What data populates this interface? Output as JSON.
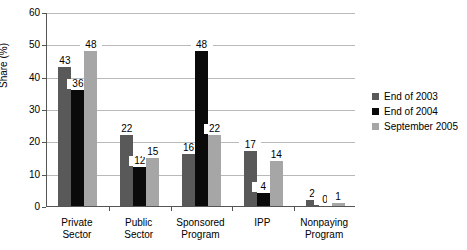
{
  "chart_data": {
    "type": "bar",
    "title": "",
    "xlabel": "",
    "ylabel": "Share (%)",
    "ylim": [
      0,
      60
    ],
    "ytick_values": [
      0,
      10,
      20,
      30,
      40,
      50,
      60
    ],
    "ytick_labels": [
      "0",
      "10",
      "20",
      "30",
      "40",
      "50",
      "60"
    ],
    "grid": true,
    "legend_position": "right",
    "categories": [
      "Private\nSector",
      "Public\nSector",
      "Sponsored\nProgram",
      "IPP",
      "Nonpaying\nProgram"
    ],
    "series": [
      {
        "name": "End of 2003",
        "color": "#595959",
        "values": [
          43,
          22,
          16,
          17,
          2
        ]
      },
      {
        "name": "End of 2004",
        "color": "#0a0a0a",
        "values": [
          36,
          12,
          48,
          4,
          0
        ]
      },
      {
        "name": "September 2005",
        "color": "#a6a6a6",
        "values": [
          48,
          15,
          22,
          14,
          1
        ]
      }
    ],
    "data_labels": [
      [
        "43",
        "36",
        "48"
      ],
      [
        "22",
        "12",
        "15"
      ],
      [
        "16",
        "48",
        "22"
      ],
      [
        "17",
        "4",
        "14"
      ],
      [
        "2",
        "0",
        "1"
      ]
    ]
  },
  "axis": {
    "y_title": "Share (%)"
  },
  "legend": {
    "items": [
      {
        "label": "End of 2003"
      },
      {
        "label": "End of 2004"
      },
      {
        "label": "September 2005"
      }
    ]
  }
}
